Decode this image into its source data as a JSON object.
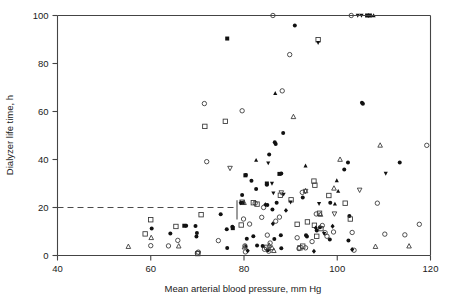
{
  "chart_data": {
    "type": "scatter",
    "title": "",
    "xlabel": "Mean arterial blood pressure, mm Hg",
    "ylabel": "Dialyzer life time, h",
    "xlim": [
      40,
      120
    ],
    "ylim": [
      0,
      100
    ],
    "xticks": [
      40,
      60,
      80,
      100,
      120
    ],
    "yticks": [
      0,
      20,
      40,
      60,
      80,
      100
    ],
    "grid": false,
    "legend": "none",
    "annotations": [
      {
        "name": "reference-line",
        "type": "dashed-horizontal",
        "y": 20,
        "x_start": 40,
        "x_end": 78,
        "note": "dashed threshold line at 20 h"
      },
      {
        "name": "reference-stub",
        "type": "short-vertical",
        "x": 78.5,
        "y_start": 15,
        "y_end": 23
      }
    ],
    "marker_kinds": [
      "filled-circle",
      "open-circle",
      "filled-square",
      "open-square",
      "filled-triangle-up",
      "open-triangle-up",
      "filled-triangle-down",
      "open-triangle-down",
      "filled-diamond"
    ],
    "series": [
      {
        "name": "filled-circle",
        "marker": "filled-circle",
        "points": [
          [
            60.2,
            11.2
          ],
          [
            64.2,
            9.2
          ],
          [
            67.6,
            12.4
          ],
          [
            69.6,
            12.3
          ],
          [
            69.9,
            9.4
          ],
          [
            69.8,
            7.9
          ],
          [
            75.0,
            17.2
          ],
          [
            76.3,
            10.9
          ],
          [
            79.6,
            25.2
          ],
          [
            79.7,
            22.0
          ],
          [
            80.4,
            33.5
          ],
          [
            81.6,
            31.1
          ],
          [
            80.6,
            7.0
          ],
          [
            82.6,
            27.7
          ],
          [
            82.8,
            4.2
          ],
          [
            84.9,
            29.5
          ],
          [
            85.0,
            21.0
          ],
          [
            85.4,
            42.1
          ],
          [
            85.1,
            2.2
          ],
          [
            86.1,
            19.2
          ],
          [
            86.6,
            47.2
          ],
          [
            86.8,
            46.5
          ],
          [
            86.5,
            6.9
          ],
          [
            87.0,
            22.0
          ],
          [
            88.0,
            34.2
          ],
          [
            88.4,
            51.0
          ],
          [
            87.9,
            8.4
          ],
          [
            90.9,
            95.8
          ],
          [
            92.6,
            24.2
          ],
          [
            93.3,
            8.4
          ],
          [
            93.5,
            7.9
          ],
          [
            95.6,
            10.4
          ],
          [
            96.3,
            11.8
          ],
          [
            98.5,
            22.0
          ],
          [
            98.4,
            6.7
          ],
          [
            101.5,
            35.8
          ],
          [
            102.3,
            38.8
          ],
          [
            102.6,
            16.5
          ],
          [
            102.4,
            6.2
          ],
          [
            105.3,
            63.6
          ],
          [
            105.5,
            63.2
          ],
          [
            113.4,
            38.7
          ],
          [
            76.4,
            3.1
          ],
          [
            84.0,
            4.0
          ],
          [
            82.0,
            8.0
          ],
          [
            88.0,
            3.0
          ],
          [
            77.5,
            12.0
          ]
        ]
      },
      {
        "name": "open-circle",
        "marker": "open-circle",
        "points": [
          [
            60.0,
            4.1
          ],
          [
            63.8,
            4.0
          ],
          [
            65.8,
            6.3
          ],
          [
            70.2,
            1.4
          ],
          [
            70.0,
            1.0
          ],
          [
            72.0,
            39.1
          ],
          [
            71.5,
            63.3
          ],
          [
            74.5,
            6.2
          ],
          [
            79.6,
            60.3
          ],
          [
            79.9,
            15.2
          ],
          [
            80.2,
            4.0
          ],
          [
            81.2,
            13.1
          ],
          [
            82.4,
            21.8
          ],
          [
            83.8,
            15.9
          ],
          [
            84.2,
            20.0
          ],
          [
            84.4,
            2.6
          ],
          [
            85.3,
            1.8
          ],
          [
            85.6,
            5.2
          ],
          [
            86.8,
            14.3
          ],
          [
            87.6,
            16.0
          ],
          [
            88.2,
            68.6
          ],
          [
            89.8,
            83.7
          ],
          [
            91.4,
            7.4
          ],
          [
            91.8,
            2.9
          ],
          [
            92.5,
            26.3
          ],
          [
            93.2,
            3.2
          ],
          [
            94.6,
            5.8
          ],
          [
            95.5,
            17.3
          ],
          [
            96.8,
            12.5
          ],
          [
            97.4,
            9.5
          ],
          [
            97.8,
            8.0
          ],
          [
            99.2,
            9.8
          ],
          [
            103.2,
            9.6
          ],
          [
            103.6,
            2.2
          ],
          [
            108.6,
            21.8
          ],
          [
            110.2,
            8.9
          ],
          [
            114.5,
            8.6
          ],
          [
            117.6,
            13.0
          ],
          [
            119.2,
            45.9
          ],
          [
            86.2,
            100.0
          ],
          [
            103.0,
            100.0
          ],
          [
            80.3,
            1.5
          ],
          [
            85.0,
            8.5
          ]
        ]
      },
      {
        "name": "filled-square",
        "marker": "filled-square",
        "points": [
          [
            76.4,
            90.4
          ],
          [
            80.3,
            33.4
          ],
          [
            77.6,
            11.4
          ],
          [
            84.9,
            30.0
          ],
          [
            87.6,
            34.0
          ],
          [
            67.2,
            12.4
          ],
          [
            107.0,
            100.0
          ],
          [
            106.4,
            100.0
          ]
        ]
      },
      {
        "name": "open-square",
        "marker": "open-square",
        "points": [
          [
            58.8,
            9.0
          ],
          [
            60.0,
            14.9
          ],
          [
            65.4,
            12.1
          ],
          [
            70.8,
            17.0
          ],
          [
            71.6,
            53.8
          ],
          [
            76.0,
            55.9
          ],
          [
            79.6,
            22.2
          ],
          [
            79.4,
            12.7
          ],
          [
            82.0,
            22.0
          ],
          [
            82.8,
            21.4
          ],
          [
            87.8,
            25.1
          ],
          [
            90.1,
            23.2
          ],
          [
            91.4,
            13.0
          ],
          [
            92.0,
            3.2
          ],
          [
            92.6,
            3.9
          ],
          [
            93.6,
            14.0
          ],
          [
            95.0,
            31.0
          ],
          [
            95.2,
            29.3
          ],
          [
            95.9,
            89.9
          ],
          [
            96.5,
            11.2
          ],
          [
            96.2,
            17.6
          ],
          [
            98.2,
            25.0
          ],
          [
            101.7,
            21.8
          ],
          [
            102.8,
            15.2
          ],
          [
            70.1,
            0.8
          ],
          [
            84.9,
            3.4
          ],
          [
            95.1,
            12.6
          ],
          [
            95.6,
            8.0
          ]
        ]
      },
      {
        "name": "filled-triangle-up",
        "marker": "filled-triangle-up",
        "points": [
          [
            82.6,
            39.7
          ],
          [
            86.7,
            67.6
          ],
          [
            93.2,
            37.4
          ],
          [
            99.9,
            31.2
          ],
          [
            100.2,
            26.8
          ],
          [
            99.5,
            21.5
          ],
          [
            107.8,
            100.0
          ],
          [
            80.4,
            4.0
          ]
        ]
      },
      {
        "name": "open-triangle-up",
        "marker": "open-triangle-up",
        "points": [
          [
            55.2,
            3.7
          ],
          [
            60.1,
            7.4
          ],
          [
            66.0,
            3.9
          ],
          [
            80.0,
            22.0
          ],
          [
            80.1,
            3.5
          ],
          [
            85.4,
            4.2
          ],
          [
            86.4,
            2.0
          ],
          [
            90.6,
            57.8
          ],
          [
            93.2,
            26.9
          ],
          [
            96.4,
            17.1
          ],
          [
            100.6,
            40.0
          ],
          [
            108.2,
            3.7
          ],
          [
            109.2,
            45.9
          ],
          [
            115.4,
            3.9
          ],
          [
            99.3,
            28.0
          ],
          [
            86.0,
            3.2
          ]
        ]
      },
      {
        "name": "filled-triangle-down",
        "marker": "filled-triangle-down",
        "points": [
          [
            85.2,
            38.5
          ],
          [
            86.3,
            26.0
          ],
          [
            88.5,
            25.5
          ],
          [
            90.0,
            22.2
          ],
          [
            95.9,
            88.7
          ],
          [
            96.1,
            21.6
          ],
          [
            104.4,
            100.0
          ],
          [
            105.2,
            100.0
          ],
          [
            110.4,
            34.2
          ],
          [
            97.2,
            9.1
          ],
          [
            86.0,
            30.0
          ]
        ]
      },
      {
        "name": "open-triangle-down",
        "marker": "open-triangle-down",
        "points": [
          [
            77.0,
            36.4
          ],
          [
            88.0,
            26.2
          ],
          [
            93.2,
            26.8
          ],
          [
            104.8,
            27.3
          ],
          [
            99.4,
            17.4
          ]
        ]
      },
      {
        "name": "filled-diamond",
        "marker": "filled-diamond",
        "points": [
          [
            79.3,
            22.0
          ],
          [
            84.6,
            21.2
          ],
          [
            89.0,
            18.8
          ],
          [
            95.4,
            11.5
          ],
          [
            99.0,
            12.2
          ],
          [
            86.2,
            13.2
          ],
          [
            95.0,
            1.8
          ],
          [
            103.2,
            2.5
          ],
          [
            80.8,
            2.0
          ]
        ]
      }
    ]
  }
}
